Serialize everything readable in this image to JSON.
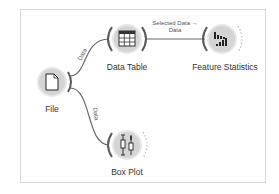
{
  "canvas": {
    "nodes": [
      {
        "id": "file",
        "label": "File",
        "icon": "file-icon",
        "x": 52,
        "y": 82
      },
      {
        "id": "data-table",
        "label": "Data Table",
        "icon": "table-icon",
        "x": 127,
        "y": 39
      },
      {
        "id": "feature-statistics",
        "label": "Feature Statistics",
        "icon": "bar-chart-icon",
        "x": 222,
        "y": 39
      },
      {
        "id": "box-plot",
        "label": "Box Plot",
        "icon": "box-plot-icon",
        "x": 127,
        "y": 145
      }
    ],
    "links": [
      {
        "from": "file",
        "to": "data-table",
        "label": "Data"
      },
      {
        "from": "file",
        "to": "box-plot",
        "label": "Data"
      },
      {
        "from": "data-table",
        "to": "feature-statistics",
        "label_line1": "Selected Data →",
        "label_line2": "Data"
      }
    ]
  },
  "colors": {
    "node_fill": "#d6d6d6",
    "node_ring": "#e4e4e4",
    "link": "#6b6b6b",
    "border": "#d8d8d8"
  }
}
